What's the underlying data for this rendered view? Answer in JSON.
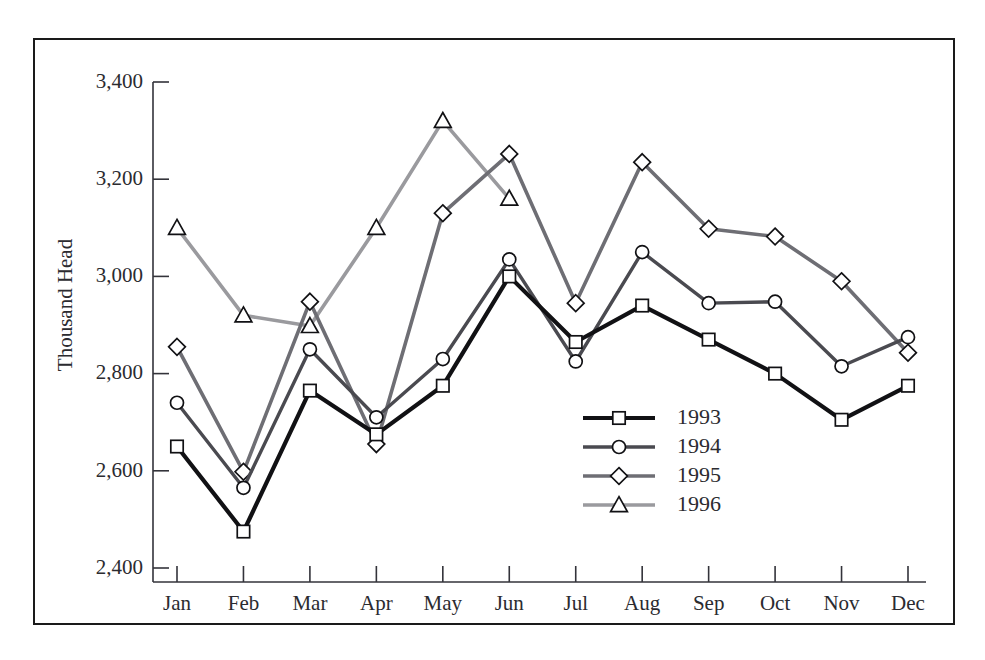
{
  "chart_data": {
    "type": "line",
    "title": "",
    "xlabel": "",
    "ylabel": "Thousand Head",
    "categories": [
      "Jan",
      "Feb",
      "Mar",
      "Apr",
      "May",
      "Jun",
      "Jul",
      "Aug",
      "Sep",
      "Oct",
      "Nov",
      "Dec"
    ],
    "ylim": [
      2400,
      3400
    ],
    "yticks": [
      2400,
      2600,
      2800,
      3000,
      3200,
      3400
    ],
    "ytick_labels": [
      "2,400",
      "2,600",
      "2,800",
      "3,000",
      "3,200",
      "3,400"
    ],
    "grid": false,
    "legend_position": "center-right-inside",
    "series": [
      {
        "name": "1993",
        "marker": "square",
        "color": "#111114",
        "values": [
          2650,
          2475,
          2765,
          2675,
          2775,
          3000,
          2865,
          2940,
          2870,
          2800,
          2705,
          2775
        ]
      },
      {
        "name": "1994",
        "marker": "circle",
        "color": "#4a4a50",
        "values": [
          2740,
          2565,
          2850,
          2710,
          2830,
          3035,
          2825,
          3050,
          2945,
          2948,
          2815,
          2875
        ]
      },
      {
        "name": "1995",
        "marker": "diamond",
        "color": "#6e6e74",
        "values": [
          2855,
          2598,
          2948,
          2655,
          3130,
          3252,
          2945,
          3235,
          3098,
          3082,
          2990,
          2843
        ]
      },
      {
        "name": "1996",
        "marker": "triangle",
        "color": "#9a9a9e",
        "values": [
          3100,
          2920,
          2898,
          3100,
          3320,
          3160,
          null,
          null,
          null,
          null,
          null,
          null
        ]
      }
    ]
  },
  "figure": {
    "border_color": "#1a1a1a",
    "background": "#ffffff",
    "axis_color": "#33333a"
  }
}
